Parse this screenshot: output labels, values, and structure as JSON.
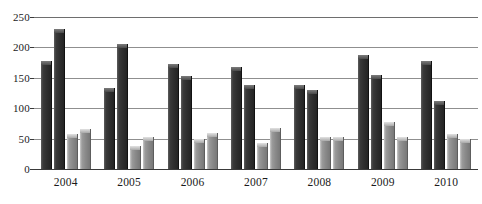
{
  "chart_data": {
    "type": "bar",
    "title": "",
    "subtitle": "",
    "xlabel": "",
    "ylabel": "",
    "categories": [
      "2004",
      "2005",
      "2006",
      "2007",
      "2008",
      "2009",
      "2010"
    ],
    "ylim": [
      0,
      250
    ],
    "yticks": [
      0,
      50,
      100,
      150,
      200,
      250
    ],
    "ytick_labels": [
      "0",
      "50",
      "100",
      "150",
      "200",
      "250"
    ],
    "grid": true,
    "grid_axis": "y",
    "legend": null,
    "legend_position": "none",
    "orientation": "vertical",
    "group_count": 7,
    "series_count": 4,
    "series": [
      {
        "name": "Series 1",
        "color": "#2f2f2f",
        "values": [
          178,
          134,
          172,
          168,
          139,
          188,
          177
        ]
      },
      {
        "name": "Series 2",
        "color": "#2f2f2f",
        "values": [
          230,
          205,
          153,
          138,
          130,
          155,
          112
        ]
      },
      {
        "name": "Series 3",
        "color": "#8a8a8a",
        "values": [
          58,
          38,
          50,
          42,
          53,
          78,
          57
        ]
      },
      {
        "name": "Series 4",
        "color": "#8a8a8a",
        "values": [
          65,
          52,
          60,
          67,
          53,
          53,
          50
        ]
      }
    ]
  },
  "colors": {
    "bar_dark": "#2f2f2f",
    "bar_light": "#8a8a8a",
    "gridline": "#8f8f8f",
    "axis": "#3a3a3a",
    "background": "#ffffff",
    "text": "#1a1a1a"
  }
}
